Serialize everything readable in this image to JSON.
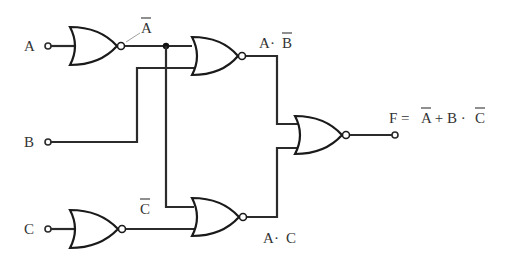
{
  "diagram": {
    "type": "logic-circuit",
    "gate_type": "NOR",
    "inputs": [
      {
        "id": "A",
        "label": "A"
      },
      {
        "id": "B",
        "label": "B"
      },
      {
        "id": "C",
        "label": "C"
      }
    ],
    "intermediate_labels": {
      "not_a": {
        "base": "A",
        "overbar": true,
        "text": "A̅"
      },
      "not_c": {
        "base": "C",
        "overbar": true,
        "text": "C̅"
      },
      "a_and_not_b": {
        "parts": [
          "A",
          " · ",
          "B"
        ],
        "overbar_on": "B",
        "text": "A · B̅"
      },
      "a_and_c": {
        "parts": [
          "A",
          " · ",
          "C"
        ],
        "text": "A · C"
      }
    },
    "output": {
      "label": "F",
      "expression_parts": [
        "F = ",
        "A",
        " + B · ",
        "C"
      ],
      "overbar_on": [
        "A",
        "C"
      ],
      "text": "F = A̅ + B · C̅"
    },
    "gates": [
      {
        "id": "g1",
        "type": "NOR",
        "inputs": [
          "A"
        ],
        "output": "not_a"
      },
      {
        "id": "g2",
        "type": "NOR",
        "inputs": [
          "not_a",
          "B"
        ],
        "output": "a_and_not_b"
      },
      {
        "id": "g3",
        "type": "NOR",
        "inputs": [
          "not_a",
          "not_c"
        ],
        "output": "a_and_c"
      },
      {
        "id": "g4",
        "type": "NOR",
        "inputs": [
          "a_and_not_b",
          "a_and_c"
        ],
        "output": "F"
      },
      {
        "id": "g5",
        "type": "NOR",
        "inputs": [
          "C"
        ],
        "output": "not_c"
      }
    ],
    "colors": {
      "line": "#1a1a1a",
      "text": "#333333",
      "background": "#ffffff"
    }
  }
}
